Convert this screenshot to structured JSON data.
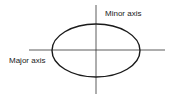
{
  "diagram": {
    "labels": {
      "minor_axis": "Minor axis",
      "major_axis": "Major axis"
    },
    "colors": {
      "ellipse_stroke": "#1a1a1a",
      "axis_stroke": "#333333",
      "background": "#ffffff"
    }
  }
}
